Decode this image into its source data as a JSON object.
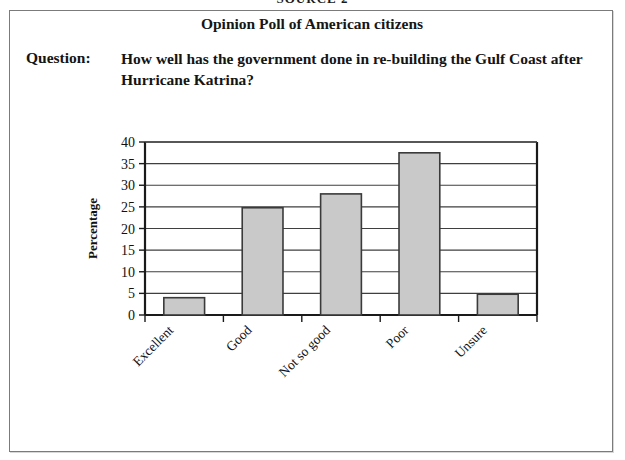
{
  "source_heading": "SOURCE 2",
  "card": {
    "title": "Opinion Poll of American citizens",
    "question_label": "Question:",
    "question_text": "How well has the government done in re-building the Gulf Coast after Hurricane Katrina?"
  },
  "colors": {
    "bar_fill": "#c9c9c9",
    "bar_stroke": "#3a3a3a",
    "axis": "#1a1a1a",
    "gridline": "#3f3f3f",
    "card_border": "#7b7b7b",
    "text": "#141414",
    "page_background": "#ffffff"
  },
  "chart_data": {
    "type": "bar",
    "title": "",
    "xlabel": "",
    "ylabel": "Percentage",
    "categories": [
      "Excellent",
      "Good",
      "Not so good",
      "Poor",
      "Unsure"
    ],
    "values": [
      4,
      24.8,
      28,
      37.5,
      4.8
    ],
    "ylim": [
      0,
      40
    ],
    "ytick_step": 5,
    "yticks": [
      "0",
      "5",
      "10",
      "15",
      "20",
      "25",
      "30",
      "35",
      "40"
    ],
    "grid": true,
    "grid_axis": "y",
    "legend": false,
    "legend_position": "none",
    "xtick_label_rotation": 45
  }
}
